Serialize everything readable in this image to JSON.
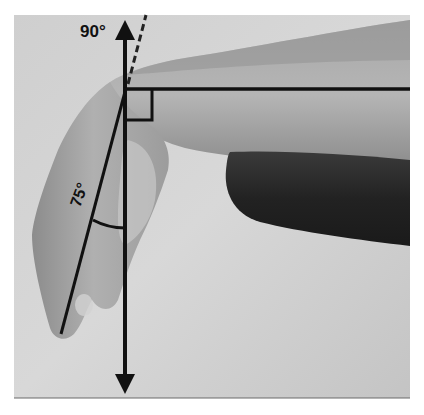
{
  "figure": {
    "labels": {
      "reference_angle": "90°",
      "measured_angle": "75°"
    },
    "colors": {
      "page_background": "#ffffff",
      "backdrop_light": "#d4d4d4",
      "backdrop_mid": "#bdbdbd",
      "skin_light": "#b8b8b8",
      "skin_mid": "#9a9a9a",
      "skin_dark": "#6e6e6e",
      "sleeve": "#262626",
      "annotation": "#111111"
    },
    "annotations": {
      "vertical_axis": {
        "x": 125,
        "y_top": 18,
        "y_bottom": 396,
        "arrows": "both"
      },
      "horizontal_forearm_line": {
        "y": 89,
        "x_start": 125,
        "x_end": 410
      },
      "right_angle_marker": {
        "x": 125,
        "y": 89,
        "size": 28
      },
      "dashed_line": {
        "from": [
          127,
          86
        ],
        "to": [
          147,
          14
        ]
      },
      "hand_axis_line": {
        "from": [
          127,
          86
        ],
        "to": [
          60,
          334
        ]
      },
      "angle_arc": {
        "between": [
          "hand_axis_line",
          "vertical_axis"
        ],
        "at_y": 225
      }
    }
  }
}
